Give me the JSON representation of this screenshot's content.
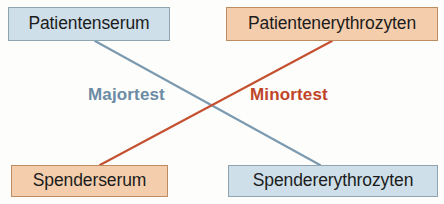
{
  "diagram": {
    "canvas": {
      "width": 444,
      "height": 204,
      "background": "#fdfdfc"
    },
    "nodes": [
      {
        "id": "patientenserum",
        "label": "Patientenserum",
        "tone": "blue",
        "fill": "#cedfe9",
        "border": "#8fa4b1",
        "position": "top-left"
      },
      {
        "id": "patientenerythrozyten",
        "label": "Patientenerythrozyten",
        "tone": "orange",
        "fill": "#f4ceac",
        "border": "#bd8d61",
        "position": "top-right"
      },
      {
        "id": "spenderserum",
        "label": "Spenderserum",
        "tone": "orange",
        "fill": "#f4ceac",
        "border": "#bd8d61",
        "position": "bottom-left"
      },
      {
        "id": "spendererythrozyten",
        "label": "Spendererythrozyten",
        "tone": "blue",
        "fill": "#cedfe9",
        "border": "#8fa4b1",
        "position": "bottom-right"
      }
    ],
    "connectors": [
      {
        "id": "majortest-line",
        "label": "Majortest",
        "color": "#7b9ab0",
        "from": "patientenserum",
        "to": "spendererythrozyten",
        "x1": 95,
        "y1": 41,
        "x2": 320,
        "y2": 165
      },
      {
        "id": "minortest-line",
        "label": "Minortest",
        "color": "#c4502f",
        "from": "patientenerythrozyten",
        "to": "spenderserum",
        "x1": 332,
        "y1": 41,
        "x2": 100,
        "y2": 165
      }
    ],
    "cross_labels": [
      {
        "id": "majortest",
        "text": "Majortest",
        "color": "#6c8ba4"
      },
      {
        "id": "minortest",
        "text": "Minortest",
        "color": "#bf4527"
      }
    ]
  }
}
